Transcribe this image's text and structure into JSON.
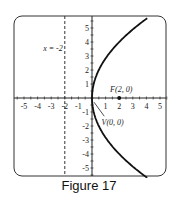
{
  "caption": "Figure 17",
  "chart_data": {
    "type": "line",
    "title": "",
    "equation": "y^2 = 8x",
    "xlim": [
      -5.5,
      5.5
    ],
    "ylim": [
      -5.5,
      5.5
    ],
    "x_ticks": [
      "-5",
      "-4",
      "-3",
      "-2",
      "-1",
      "1",
      "2",
      "3",
      "4",
      "5"
    ],
    "y_ticks": [
      "5",
      "4",
      "3",
      "2",
      "1",
      "-1",
      "-2",
      "-3",
      "-4",
      "-5"
    ],
    "directrix": {
      "label": "x = -2",
      "x": -2,
      "style": "dashed"
    },
    "focus": {
      "label": "F(2, 0)",
      "x": 2,
      "y": 0
    },
    "vertex": {
      "label": "V(0, 0)",
      "x": 0,
      "y": 0
    },
    "grid": false
  }
}
